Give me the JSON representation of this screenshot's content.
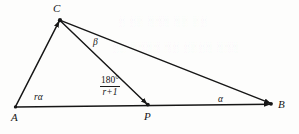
{
  "figure": {
    "type": "geometry-diagram",
    "background_color": "#fdfdfc",
    "stroke_color": "#161616",
    "vertices": [
      {
        "id": "A",
        "label": "A",
        "x": 15,
        "y": 107,
        "label_x": 11,
        "label_y": 112,
        "dot": false
      },
      {
        "id": "C",
        "label": "C",
        "x": 60,
        "y": 20,
        "label_x": 53,
        "label_y": 3,
        "dot": true
      },
      {
        "id": "P",
        "label": "P",
        "x": 148,
        "y": 105,
        "label_x": 144,
        "label_y": 111,
        "dot": true
      },
      {
        "id": "B",
        "label": "B",
        "x": 272,
        "y": 104,
        "label_x": 278,
        "label_y": 99,
        "dot": true
      }
    ],
    "segments": [
      {
        "id": "AC",
        "from": "A",
        "to": "C",
        "arrow": true
      },
      {
        "id": "AB",
        "from": "A",
        "to": "B",
        "arrow": true
      },
      {
        "id": "CP",
        "from": "C",
        "to": "P",
        "arrow": true
      },
      {
        "id": "CB",
        "from": "C",
        "to": "B",
        "arrow": true
      }
    ],
    "angle_labels": [
      {
        "id": "angle-A",
        "at": "A",
        "text": "rα",
        "x": 34,
        "y": 93
      },
      {
        "id": "angle-C-beta",
        "at": "C",
        "text": "β",
        "x": 93,
        "y": 38
      },
      {
        "id": "angle-B",
        "at": "B",
        "text": "α",
        "x": 218,
        "y": 95
      }
    ],
    "fraction_label": {
      "id": "angle-CPB",
      "numerator": "180°",
      "denominator": "r+1",
      "x": 100,
      "y": 76
    },
    "ghost_artifacts": [
      {
        "text": "░ ░░ ░░░ ░░ ░░",
        "x": 118,
        "y": 16
      },
      {
        "text": "░░ ░░░░ ░░ ░░░░ ░░░",
        "x": 112,
        "y": 42
      }
    ]
  }
}
